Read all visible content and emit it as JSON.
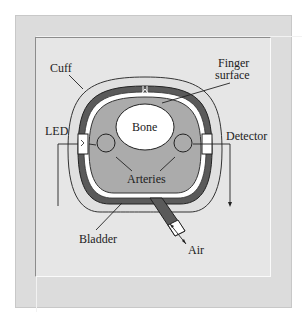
{
  "diagram": {
    "labels": {
      "cuff": "Cuff",
      "finger_surface_line1": "Finger",
      "finger_surface_line2": "surface",
      "bone": "Bone",
      "led": "LED",
      "detector": "Detector",
      "arteries": "Arteries",
      "bladder": "Bladder",
      "air": "Air"
    },
    "colors": {
      "frame": "#dcdcdc",
      "panel": "#e6e6e6",
      "tissue": "#a9a9a9",
      "bladder": "#555555",
      "bone": "#ffffff",
      "outline": "#2a2a2a"
    }
  }
}
